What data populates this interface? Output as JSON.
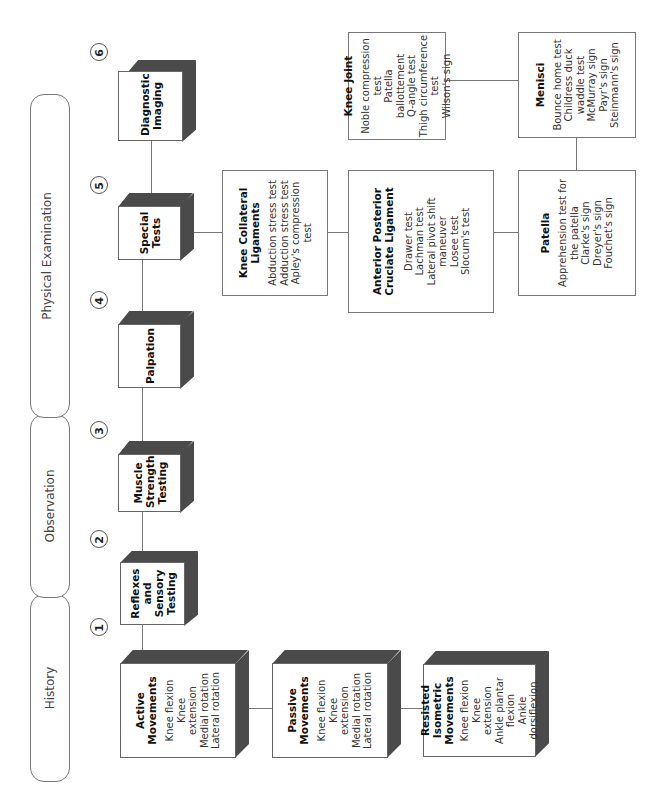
{
  "phases": [
    {
      "label": "History"
    },
    {
      "label": "Observation"
    },
    {
      "label": "Physical Examination"
    }
  ],
  "steps": [
    "1",
    "2",
    "3",
    "4",
    "5",
    "6"
  ],
  "main_boxes": {
    "reflexes": {
      "title": "Reflexes and Sensory Testing"
    },
    "muscle": {
      "title": "Muscle Strength Testing"
    },
    "palpation": {
      "title": "Palpation"
    },
    "special": {
      "title": "Special Tests"
    },
    "imaging": {
      "title": "Diagnostic Imaging"
    }
  },
  "movement_boxes": {
    "active": {
      "title": "Active Movements",
      "items": [
        "Knee flexion",
        "Knee extension",
        "Medial rotation",
        "Lateral rotation"
      ]
    },
    "passive": {
      "title": "Passive Movements",
      "items": [
        "Knee flexion",
        "Knee extension",
        "Medial rotation",
        "Lateral rotation"
      ]
    },
    "resisted": {
      "title": "Resisted Isometric Movements",
      "items": [
        "Knee flexion",
        "Knee extension",
        "Ankle plantar flexion",
        "Ankle dorsiflexion"
      ]
    }
  },
  "test_boxes": {
    "collateral": {
      "title": "Knee Collateral Ligaments",
      "items": [
        "Abduction stress test",
        "Adduction stress test",
        "Apley's compression test"
      ]
    },
    "cruciate": {
      "title": "Anterior Posterior Cruciate Ligament",
      "items": [
        "Drawer test",
        "Lachman test",
        "Lateral pivot shift maneuver",
        "Losee test",
        "Slocum's test"
      ]
    },
    "patella": {
      "title": "Patella",
      "items": [
        "Apprehension test for the patella",
        "Clarke's sign",
        "Dreyer's sign",
        "Fouchet's sign"
      ]
    },
    "knee_joint": {
      "title": "Knee Joint",
      "items": [
        "Noble compression test",
        "Patella ballottement",
        "Q-angle test",
        "Thigh circumference test",
        "Wilson's sign"
      ]
    },
    "menisci": {
      "title": "Menisci",
      "items": [
        "Bounce home test",
        "Childress duck waddle test",
        "McMurray sign",
        "Payr's sign",
        "Steinmann's sign"
      ]
    }
  },
  "colors": {
    "box_shadow": "#4a4a4a",
    "border": "#777777",
    "text": "#222222"
  }
}
